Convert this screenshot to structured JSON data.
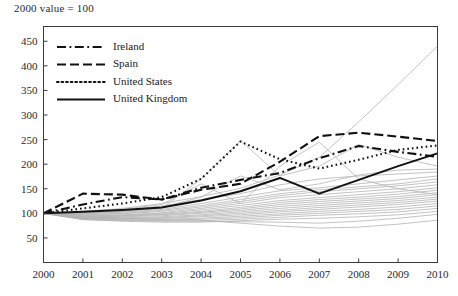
{
  "chart_title": "2000 value = 100",
  "axes": {
    "y_ticks": [
      50,
      100,
      150,
      200,
      250,
      300,
      350,
      400,
      450
    ],
    "x_ticks": [
      "2000",
      "2001",
      "2002",
      "2003",
      "2004",
      "2005",
      "2006",
      "2007",
      "2008",
      "2009",
      "2010"
    ]
  },
  "legend": {
    "items": [
      {
        "label": "Ireland",
        "style": "dash-dot"
      },
      {
        "label": "Spain",
        "style": "dashed"
      },
      {
        "label": "United States",
        "style": "dotted"
      },
      {
        "label": "United Kingdom",
        "style": "solid"
      }
    ]
  },
  "chart_data": {
    "type": "line",
    "title": "2000 value = 100",
    "xlabel": "",
    "ylabel": "",
    "x": [
      2000,
      2001,
      2002,
      2003,
      2004,
      2005,
      2006,
      2007,
      2008,
      2009,
      2010
    ],
    "xlim": [
      2000,
      2010
    ],
    "ylim": [
      0,
      480
    ],
    "grid": false,
    "legend_position": "top-left",
    "note": "Index, 2000 value = 100. Four named series drawn in black; remaining country series drawn as thin grey background lines.",
    "series": [
      {
        "name": "Ireland",
        "style": "dash-dot",
        "color": "#111111",
        "highlight": true,
        "values": [
          100,
          118,
          133,
          128,
          152,
          168,
          182,
          212,
          237,
          225,
          215
        ]
      },
      {
        "name": "Spain",
        "style": "dashed",
        "color": "#111111",
        "highlight": true,
        "values": [
          100,
          140,
          138,
          128,
          148,
          160,
          205,
          257,
          264,
          256,
          247
        ]
      },
      {
        "name": "United States",
        "style": "dotted",
        "color": "#111111",
        "highlight": true,
        "values": [
          100,
          110,
          120,
          133,
          170,
          246,
          210,
          191,
          209,
          229,
          238
        ]
      },
      {
        "name": "United Kingdom",
        "style": "solid",
        "color": "#111111",
        "highlight": true,
        "values": [
          100,
          103,
          107,
          112,
          126,
          145,
          172,
          140,
          168,
          196,
          222
        ]
      }
    ],
    "background_series": [
      {
        "name": "bg-1",
        "values": [
          100,
          104,
          110,
          120,
          134,
          151,
          178,
          214,
          286,
          362,
          440
        ]
      },
      {
        "name": "bg-2",
        "values": [
          100,
          101,
          103,
          110,
          170,
          248,
          176,
          196,
          240,
          214,
          196
        ]
      },
      {
        "name": "bg-3",
        "values": [
          100,
          103,
          108,
          118,
          160,
          120,
          196,
          245,
          170,
          150,
          138
        ]
      },
      {
        "name": "bg-4",
        "values": [
          100,
          100,
          104,
          112,
          133,
          176,
          148,
          160,
          178,
          188,
          190
        ]
      },
      {
        "name": "bg-5",
        "values": [
          100,
          102,
          106,
          115,
          128,
          140,
          158,
          170,
          176,
          180,
          184
        ]
      },
      {
        "name": "bg-6",
        "values": [
          100,
          99,
          102,
          108,
          120,
          133,
          146,
          152,
          160,
          168,
          176
        ]
      },
      {
        "name": "bg-7",
        "values": [
          100,
          98,
          100,
          106,
          116,
          128,
          140,
          148,
          154,
          160,
          170
        ]
      },
      {
        "name": "bg-8",
        "values": [
          100,
          97,
          99,
          104,
          113,
          124,
          136,
          144,
          150,
          156,
          164
        ]
      },
      {
        "name": "bg-9",
        "values": [
          100,
          96,
          97,
          101,
          110,
          120,
          132,
          138,
          144,
          150,
          158
        ]
      },
      {
        "name": "bg-10",
        "values": [
          100,
          95,
          96,
          100,
          107,
          116,
          126,
          132,
          138,
          144,
          152
        ]
      },
      {
        "name": "bg-11",
        "values": [
          100,
          94,
          95,
          98,
          104,
          112,
          122,
          128,
          133,
          139,
          147
        ]
      },
      {
        "name": "bg-12",
        "values": [
          100,
          93,
          94,
          97,
          102,
          109,
          118,
          124,
          129,
          134,
          142
        ]
      },
      {
        "name": "bg-13",
        "values": [
          100,
          92,
          93,
          95,
          100,
          106,
          114,
          120,
          125,
          130,
          138
        ]
      },
      {
        "name": "bg-14",
        "values": [
          100,
          92,
          91,
          93,
          97,
          103,
          110,
          116,
          121,
          126,
          133
        ]
      },
      {
        "name": "bg-15",
        "values": [
          100,
          91,
          90,
          91,
          95,
          100,
          106,
          112,
          117,
          122,
          129
        ]
      },
      {
        "name": "bg-16",
        "values": [
          100,
          90,
          89,
          90,
          93,
          97,
          103,
          108,
          113,
          118,
          125
        ]
      },
      {
        "name": "bg-17",
        "values": [
          100,
          89,
          88,
          88,
          90,
          94,
          99,
          104,
          108,
          113,
          120
        ]
      },
      {
        "name": "bg-18",
        "values": [
          100,
          88,
          86,
          86,
          88,
          91,
          96,
          100,
          104,
          108,
          115
        ]
      },
      {
        "name": "bg-19",
        "values": [
          100,
          88,
          85,
          84,
          85,
          88,
          92,
          96,
          99,
          103,
          110
        ]
      },
      {
        "name": "bg-20",
        "values": [
          100,
          87,
          84,
          82,
          82,
          85,
          88,
          90,
          93,
          97,
          104
        ]
      },
      {
        "name": "bg-21",
        "values": [
          100,
          90,
          87,
          85,
          84,
          83,
          82,
          80,
          84,
          90,
          98
        ]
      },
      {
        "name": "bg-22",
        "values": [
          100,
          93,
          90,
          88,
          86,
          80,
          74,
          70,
          72,
          78,
          86
        ]
      }
    ]
  }
}
